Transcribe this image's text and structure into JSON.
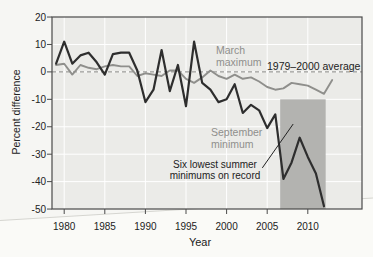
{
  "figure": {
    "annotations": {
      "march_line1": "March",
      "march_line2": "maximum",
      "average": "1979–2000 average",
      "september_line1": "September",
      "september_line2": "minimum",
      "lowest_line1": "Six lowest summer",
      "lowest_line2": "minimums on record"
    },
    "colors": {
      "september_line": "#2e2e2e",
      "march_line": "#8f8f8c",
      "highlight_box": "#b3b3b0",
      "plot_bg": "#ebebe8",
      "grid": "#ffffff",
      "dashed_average": "#9b9b98",
      "axis": "#4a4a4a",
      "dark_text": "#222222",
      "gray_text": "#8f8f8c",
      "page_bg": "#f6f6f3",
      "crease": "#d5d5d0",
      "page_below_crease": "#fafaf7"
    }
  },
  "chart_data": {
    "type": "line",
    "title": "",
    "xlabel": "Year",
    "ylabel": "Percent difference",
    "xlim": [
      1978.5,
      2016.7
    ],
    "ylim": [
      -50,
      20
    ],
    "xticks": [
      1980,
      1985,
      1990,
      1995,
      2000,
      2005,
      2010
    ],
    "yticks": [
      20,
      10,
      0,
      -10,
      -20,
      -30,
      -40,
      -50
    ],
    "grid": true,
    "reference_line": {
      "label": "1979–2000 average",
      "y": 0
    },
    "highlight_region": {
      "label": "Six lowest summer minimums on record",
      "x_start": 2006.6,
      "x_end": 2012.2,
      "y_top": -10,
      "y_bottom": -50
    },
    "callout": {
      "x1": 2004.4,
      "v1": -35,
      "x2": 2008.2,
      "v2": -19
    },
    "series": [
      {
        "name": "March maximum",
        "x_start": 1979,
        "values": [
          2.5,
          3,
          -1,
          2.5,
          1.5,
          1,
          2,
          2.5,
          2,
          2,
          -1.5,
          -0.5,
          -1,
          -1.5,
          0.5,
          0.5,
          -2.5,
          -4,
          -2,
          0.5,
          -1.5,
          -2.5,
          -1,
          -2.5,
          -2,
          -3.5,
          -5.5,
          -6.5,
          -6,
          -4,
          -4.5,
          -5,
          -6.5,
          -8,
          -3
        ]
      },
      {
        "name": "September minimum",
        "x_start": 1979,
        "values": [
          3,
          11,
          3,
          6,
          7,
          3.5,
          -1,
          6.5,
          7,
          7,
          0.5,
          -11,
          -6.5,
          8,
          -7,
          2.5,
          -12.5,
          11,
          -4,
          -6.5,
          -11,
          -10,
          -4.5,
          -15,
          -12,
          -14,
          -20.5,
          -15.5,
          -39,
          -33,
          -24,
          -31,
          -37,
          -49
        ]
      }
    ]
  }
}
